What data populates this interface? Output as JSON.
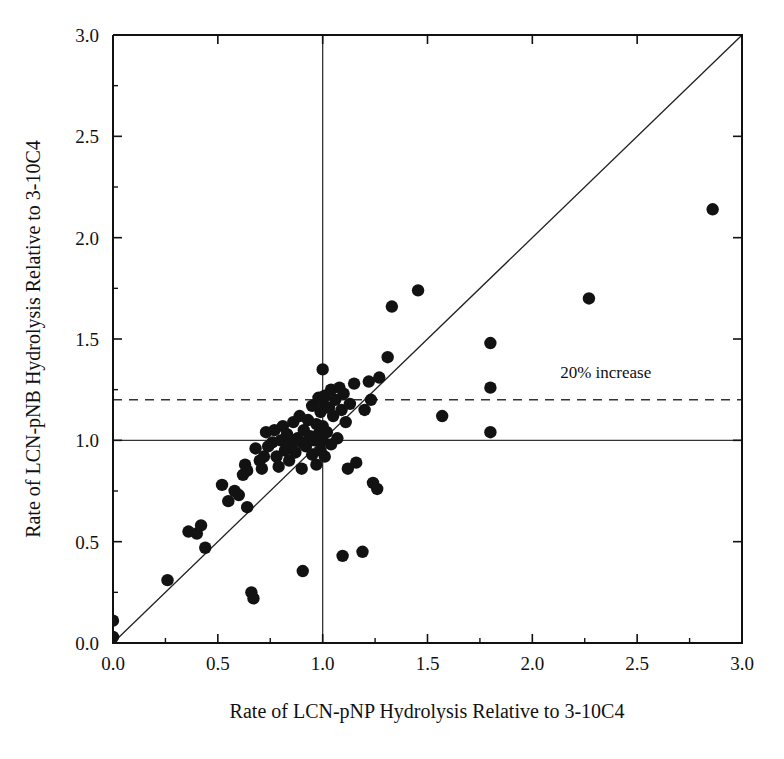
{
  "chart_data": {
    "type": "scatter",
    "title": "",
    "xlabel": "Rate of LCN-pNP  Hydrolysis Relative to 3-10C4",
    "ylabel": "Rate of LCN-pNB  Hydrolysis Relative to 3-10C4",
    "xlim": [
      0.0,
      3.0
    ],
    "ylim": [
      0.0,
      3.0
    ],
    "xticks": [
      "0.0",
      "0.5",
      "1.0",
      "1.5",
      "2.0",
      "2.5",
      "3.0"
    ],
    "xtick_values": [
      0.0,
      0.5,
      1.0,
      1.5,
      2.0,
      2.5,
      3.0
    ],
    "yticks": [
      "0.0",
      "0.5",
      "1.0",
      "1.5",
      "2.0",
      "2.5",
      "3.0"
    ],
    "ytick_values": [
      0.0,
      0.5,
      1.0,
      1.5,
      2.0,
      2.5,
      3.0
    ],
    "minor_tick_values": [
      0.25,
      0.75,
      1.25,
      1.75,
      2.25,
      2.75
    ],
    "grid": false,
    "legend": false,
    "marker": "filled-circle",
    "marker_color": "#121212",
    "marker_radius": 6.2,
    "annotations": [
      {
        "name": "twenty-percent-increase-label",
        "text": "20% increase",
        "x": 2.35,
        "y": 1.31
      }
    ],
    "reference_lines": [
      {
        "name": "horizontal-unity-line",
        "orientation": "horizontal",
        "value": 1.0,
        "style": "solid"
      },
      {
        "name": "vertical-unity-line",
        "orientation": "vertical",
        "value": 1.0,
        "style": "solid"
      },
      {
        "name": "twenty-percent-line",
        "orientation": "horizontal",
        "value": 1.2,
        "style": "dashed"
      },
      {
        "name": "identity-line",
        "orientation": "diagonal",
        "from": [
          0.0,
          0.0
        ],
        "to": [
          3.0,
          3.0
        ],
        "style": "solid"
      }
    ],
    "points": [
      [
        0.0,
        0.11
      ],
      [
        0.0,
        0.03
      ],
      [
        0.26,
        0.31
      ],
      [
        0.36,
        0.55
      ],
      [
        0.4,
        0.54
      ],
      [
        0.42,
        0.58
      ],
      [
        0.44,
        0.47
      ],
      [
        0.52,
        0.78
      ],
      [
        0.55,
        0.7
      ],
      [
        0.58,
        0.75
      ],
      [
        0.6,
        0.73
      ],
      [
        0.62,
        0.83
      ],
      [
        0.63,
        0.88
      ],
      [
        0.64,
        0.85
      ],
      [
        0.64,
        0.67
      ],
      [
        0.66,
        0.25
      ],
      [
        0.67,
        0.22
      ],
      [
        0.68,
        0.96
      ],
      [
        0.7,
        0.9
      ],
      [
        0.71,
        0.86
      ],
      [
        0.72,
        0.92
      ],
      [
        0.73,
        1.04
      ],
      [
        0.74,
        0.97
      ],
      [
        0.76,
        0.99
      ],
      [
        0.77,
        1.05
      ],
      [
        0.78,
        0.92
      ],
      [
        0.79,
        0.87
      ],
      [
        0.8,
        1.0
      ],
      [
        0.81,
        1.07
      ],
      [
        0.82,
        0.95
      ],
      [
        0.83,
        1.03
      ],
      [
        0.84,
        0.9
      ],
      [
        0.85,
        0.98
      ],
      [
        0.86,
        1.09
      ],
      [
        0.87,
        0.94
      ],
      [
        0.88,
        1.01
      ],
      [
        0.89,
        1.12
      ],
      [
        0.9,
        0.99
      ],
      [
        0.9,
        0.86
      ],
      [
        0.905,
        0.355
      ],
      [
        0.91,
        1.05
      ],
      [
        0.92,
        0.97
      ],
      [
        0.93,
        1.1
      ],
      [
        0.94,
        1.02
      ],
      [
        0.95,
        0.93
      ],
      [
        0.95,
        1.17
      ],
      [
        0.96,
        1.0
      ],
      [
        0.97,
        1.08
      ],
      [
        0.97,
        0.88
      ],
      [
        0.98,
        1.21
      ],
      [
        0.98,
        1.03
      ],
      [
        0.99,
        0.95
      ],
      [
        0.99,
        1.14
      ],
      [
        1.0,
        1.0
      ],
      [
        1.0,
        1.07
      ],
      [
        1.0,
        1.19
      ],
      [
        1.0,
        1.35
      ],
      [
        1.01,
        0.92
      ],
      [
        1.01,
        1.22
      ],
      [
        1.02,
        1.04
      ],
      [
        1.03,
        1.16
      ],
      [
        1.04,
        1.25
      ],
      [
        1.04,
        0.98
      ],
      [
        1.05,
        1.12
      ],
      [
        1.06,
        1.2
      ],
      [
        1.07,
        1.01
      ],
      [
        1.08,
        1.26
      ],
      [
        1.09,
        1.15
      ],
      [
        1.095,
        0.43
      ],
      [
        1.1,
        1.23
      ],
      [
        1.11,
        1.09
      ],
      [
        1.12,
        0.86
      ],
      [
        1.13,
        1.18
      ],
      [
        1.15,
        1.28
      ],
      [
        1.16,
        0.89
      ],
      [
        1.19,
        0.45
      ],
      [
        1.2,
        1.15
      ],
      [
        1.22,
        1.29
      ],
      [
        1.23,
        1.2
      ],
      [
        1.24,
        0.79
      ],
      [
        1.26,
        0.76
      ],
      [
        1.27,
        1.31
      ],
      [
        1.31,
        1.41
      ],
      [
        1.33,
        1.66
      ],
      [
        1.455,
        1.74
      ],
      [
        1.57,
        1.12
      ],
      [
        1.8,
        1.48
      ],
      [
        1.8,
        1.26
      ],
      [
        1.8,
        1.04
      ],
      [
        2.27,
        1.7
      ],
      [
        2.86,
        2.14
      ]
    ]
  },
  "layout": {
    "plot_left_px": 113,
    "plot_right_px": 742,
    "plot_top_px": 35,
    "plot_bottom_px": 643
  }
}
